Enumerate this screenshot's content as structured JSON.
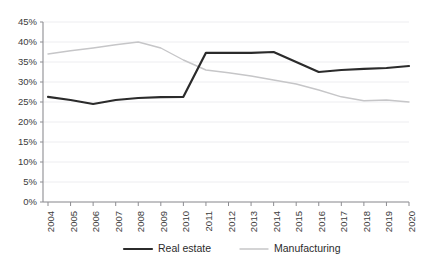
{
  "chart_data": {
    "type": "line",
    "title": "",
    "xlabel": "",
    "ylabel": "",
    "ylim": [
      0,
      45
    ],
    "ytick_labels": [
      "0%",
      "5%",
      "10%",
      "15%",
      "20%",
      "25%",
      "30%",
      "35%",
      "40%",
      "45%"
    ],
    "ytick_values": [
      0,
      5,
      10,
      15,
      20,
      25,
      30,
      35,
      40,
      45
    ],
    "grid": true,
    "legend_position": "bottom",
    "categories": [
      "2004",
      "2005",
      "2006",
      "2007",
      "2008",
      "2009",
      "2010",
      "2011",
      "2012",
      "2013",
      "2014",
      "2015",
      "2016",
      "2017",
      "2018",
      "2019",
      "2020"
    ],
    "series": [
      {
        "name": "Real estate",
        "color": "#2b2b2b",
        "width": 2.2,
        "values": [
          26.3,
          25.5,
          24.5,
          25.5,
          26.0,
          26.2,
          26.3,
          37.3,
          37.3,
          37.3,
          37.5,
          35.0,
          32.5,
          33.0,
          33.3,
          33.5,
          34.0
        ]
      },
      {
        "name": "Manufacturing",
        "color": "#c6c6c8",
        "width": 1.4,
        "values": [
          37.0,
          37.8,
          38.5,
          39.3,
          40.0,
          38.5,
          35.5,
          33.0,
          32.3,
          31.5,
          30.5,
          29.5,
          28.0,
          26.3,
          25.3,
          25.5,
          25.0
        ]
      }
    ]
  },
  "legend": {
    "items": [
      {
        "label": "Real estate"
      },
      {
        "label": "Manufacturing"
      }
    ]
  }
}
